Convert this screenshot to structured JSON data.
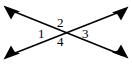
{
  "figure": {
    "type": "geometry-diagram",
    "background_color": "#ffffff",
    "stroke_color": "#000000",
    "stroke_width": 1.6,
    "intersection_point": {
      "x": 65,
      "y": 32
    },
    "lines": [
      {
        "name": "line-nw-se",
        "start": {
          "x": 4,
          "y": 6
        },
        "end": {
          "x": 128,
          "y": 58
        },
        "arrow_start": true,
        "arrow_end": true
      },
      {
        "name": "line-sw-ne",
        "start": {
          "x": 4,
          "y": 59
        },
        "end": {
          "x": 128,
          "y": 7
        },
        "arrow_start": true,
        "arrow_end": true
      }
    ],
    "arrowheads": [
      {
        "name": "arrowhead-top-left",
        "direction": "up-left",
        "tip": {
          "x": 4,
          "y": 6
        }
      },
      {
        "name": "arrowhead-top-right",
        "direction": "up-right",
        "tip": {
          "x": 128,
          "y": 7
        }
      },
      {
        "name": "arrowhead-bottom-left",
        "direction": "down-left",
        "tip": {
          "x": 4,
          "y": 59
        }
      },
      {
        "name": "arrowhead-bottom-right",
        "direction": "down-right",
        "tip": {
          "x": 128,
          "y": 58
        }
      }
    ],
    "angle_labels": [
      {
        "id": "1",
        "text": "1",
        "position": "left",
        "x": 43,
        "y": 33
      },
      {
        "id": "2",
        "text": "2",
        "position": "top",
        "x": 62,
        "y": 22
      },
      {
        "id": "3",
        "text": "3",
        "position": "right",
        "x": 87,
        "y": 33
      },
      {
        "id": "4",
        "text": "4",
        "position": "bottom",
        "x": 62,
        "y": 41
      }
    ]
  }
}
